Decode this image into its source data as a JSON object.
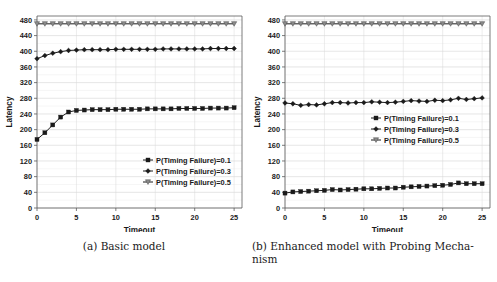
{
  "figure": {
    "panels": [
      {
        "id": "panel-a",
        "caption": "(a) Basic model",
        "chart_data": {
          "type": "line",
          "title": "",
          "xlabel": "Timeout",
          "ylabel": "Latency",
          "xlim": [
            0,
            26
          ],
          "ylim": [
            0,
            490
          ],
          "xticks": [
            0,
            5,
            10,
            15,
            20,
            25
          ],
          "yticks": [
            0,
            40,
            80,
            120,
            160,
            200,
            240,
            280,
            320,
            360,
            400,
            440,
            480
          ],
          "grid": true,
          "legend_position": "lower-right",
          "x": [
            0,
            1,
            2,
            3,
            4,
            5,
            6,
            7,
            8,
            9,
            10,
            11,
            12,
            13,
            14,
            15,
            16,
            17,
            18,
            19,
            20,
            21,
            22,
            23,
            24,
            25
          ],
          "series": [
            {
              "name": "P(Timing Failure)=0.1",
              "marker": "square",
              "values": [
                175,
                192,
                212,
                232,
                245,
                249,
                250,
                251,
                251,
                251,
                252,
                252,
                252,
                252,
                253,
                253,
                253,
                253,
                254,
                254,
                254,
                254,
                255,
                255,
                255,
                256
              ]
            },
            {
              "name": "P(Timing Failure)=0.3",
              "marker": "diamond",
              "values": [
                381,
                389,
                395,
                399,
                402,
                403,
                404,
                404,
                404,
                404,
                405,
                405,
                405,
                405,
                405,
                405,
                406,
                406,
                406,
                406,
                406,
                406,
                407,
                407,
                407,
                407
              ]
            },
            {
              "name": "P(Timing Failure)=0.5",
              "marker": "triangle-down",
              "values": [
                470,
                470,
                470,
                470,
                470,
                470,
                470,
                470,
                470,
                470,
                470,
                470,
                470,
                470,
                470,
                470,
                470,
                470,
                470,
                470,
                470,
                470,
                470,
                470,
                470,
                470
              ]
            }
          ]
        }
      },
      {
        "id": "panel-b",
        "caption": "(b) Enhanced model with Probing Mecha-",
        "caption_line2": "nism",
        "chart_data": {
          "type": "line",
          "title": "",
          "xlabel": "Timeout",
          "ylabel": "Latency",
          "xlim": [
            0,
            26
          ],
          "ylim": [
            0,
            490
          ],
          "xticks": [
            0,
            5,
            10,
            15,
            20,
            25
          ],
          "yticks": [
            0,
            40,
            80,
            120,
            160,
            200,
            240,
            280,
            320,
            360,
            400,
            440,
            480
          ],
          "grid": true,
          "legend_position": "middle-right",
          "x": [
            0,
            1,
            2,
            3,
            4,
            5,
            6,
            7,
            8,
            9,
            10,
            11,
            12,
            13,
            14,
            15,
            16,
            17,
            18,
            19,
            20,
            21,
            22,
            23,
            24,
            25
          ],
          "series": [
            {
              "name": "P(Timing Failure)=0.1",
              "marker": "square",
              "values": [
                38,
                41,
                42,
                43,
                44,
                45,
                47,
                46,
                47,
                48,
                49,
                49,
                50,
                51,
                51,
                53,
                54,
                55,
                56,
                57,
                58,
                60,
                64,
                62,
                62,
                62
              ]
            },
            {
              "name": "P(Timing Failure)=0.3",
              "marker": "diamond",
              "values": [
                268,
                266,
                262,
                264,
                263,
                266,
                269,
                269,
                268,
                269,
                269,
                271,
                270,
                269,
                270,
                272,
                274,
                273,
                272,
                275,
                274,
                276,
                280,
                277,
                279,
                281
              ]
            },
            {
              "name": "P(Timing Failure)=0.5",
              "marker": "triangle-down",
              "values": [
                470,
                470,
                470,
                470,
                470,
                470,
                470,
                470,
                470,
                470,
                470,
                470,
                470,
                470,
                470,
                470,
                470,
                470,
                470,
                470,
                470,
                470,
                470,
                470,
                470,
                470
              ]
            }
          ]
        }
      }
    ]
  },
  "colors": {
    "line": "#1a1a1a",
    "grid": "#d8d8d8",
    "axis": "#5a5a5a",
    "background": "#ffffff"
  }
}
